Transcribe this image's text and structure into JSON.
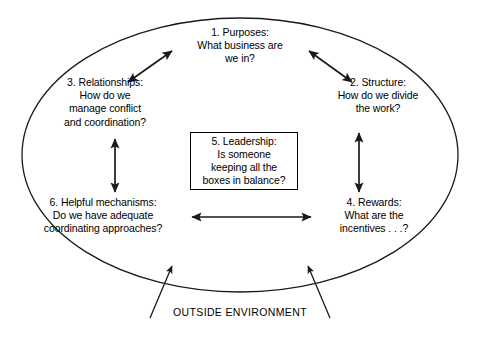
{
  "diagram": {
    "stroke_color": "#1a1a1a",
    "text_color": "#000000",
    "background_color": "#ffffff",
    "boxes": [
      {
        "id": "purposes",
        "number": "1.",
        "heading": "1. Purposes:",
        "question": "What business are\nwe in?",
        "text": "1. Purposes:\nWhat business are\nwe in?",
        "position": "top-center"
      },
      {
        "id": "structure",
        "number": "2.",
        "heading": "2. Structure:",
        "question": "How do we divide\nthe work?",
        "text": "2. Structure:\nHow do we divide\nthe work?",
        "position": "right-upper"
      },
      {
        "id": "relationships",
        "number": "3.",
        "heading": "3. Relationships:",
        "question": "How do we\nmanage conflict\nand coordination?",
        "text": "3. Relationships:\nHow do we\nmanage conflict\nand coordination?",
        "position": "left-upper"
      },
      {
        "id": "rewards",
        "number": "4.",
        "heading": "4. Rewards:",
        "question": "What are the\nincentives . . .?",
        "text": "4. Rewards:\nWhat are the\nincentives . . .?",
        "position": "right-lower"
      },
      {
        "id": "leadership",
        "number": "5.",
        "heading": "5. Leadership:",
        "question": "Is someone\nkeeping all the\nboxes in balance?",
        "text": "5. Leadership:\nIs someone\nkeeping all the\nboxes in balance?",
        "position": "center"
      },
      {
        "id": "helpful-mechanisms",
        "number": "6.",
        "heading": "6. Helpful mechanisms:",
        "question": "Do we have adequate\ncoordinating approaches?",
        "text": "6. Helpful mechanisms:\nDo we have adequate\ncoordinating approaches?",
        "position": "left-lower"
      }
    ],
    "environment_label": "OUTSIDE ENVIRONMENT",
    "connectors": [
      {
        "id": "relationships-purposes",
        "style": "double-headed-arrow",
        "orientation": "diagonal-up-right"
      },
      {
        "id": "purposes-structure",
        "style": "double-headed-arrow",
        "orientation": "diagonal-down-right"
      },
      {
        "id": "relationships-helpful",
        "style": "double-headed-arrow",
        "orientation": "vertical"
      },
      {
        "id": "structure-rewards",
        "style": "double-headed-arrow",
        "orientation": "vertical"
      },
      {
        "id": "helpful-rewards",
        "style": "double-headed-arrow",
        "orientation": "horizontal"
      },
      {
        "id": "environment-inflow-left",
        "style": "single-headed-arrow",
        "orientation": "diagonal-up-right"
      },
      {
        "id": "environment-inflow-right",
        "style": "single-headed-arrow",
        "orientation": "diagonal-up-left"
      }
    ]
  }
}
